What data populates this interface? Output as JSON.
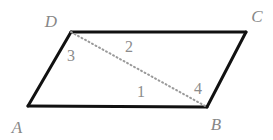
{
  "figure": {
    "background_color": "#ffffff",
    "width": 273,
    "height": 140,
    "edge_color": "#111111",
    "edge_width": 3,
    "diagonal_color": "#9a9a9a",
    "diagonal_style": "dotted",
    "diagonal_width": 2,
    "vertex_label_color": "#878787",
    "angle_label_color": "#8c8c8c"
  },
  "vertices": [
    {
      "id": "A",
      "label": "A",
      "x": 28,
      "y": 106,
      "label_x": 17,
      "label_y": 127
    },
    {
      "id": "B",
      "label": "B",
      "x": 207,
      "y": 107,
      "label_x": 216,
      "label_y": 124
    },
    {
      "id": "C",
      "label": "C",
      "x": 246,
      "y": 32,
      "label_x": 257,
      "label_y": 16
    },
    {
      "id": "D",
      "label": "D",
      "x": 71,
      "y": 32,
      "label_x": 51,
      "label_y": 21
    }
  ],
  "edges": [
    {
      "id": "AB",
      "from": "A",
      "to": "B",
      "style": "solid"
    },
    {
      "id": "BC",
      "from": "B",
      "to": "C",
      "style": "solid"
    },
    {
      "id": "CD",
      "from": "C",
      "to": "D",
      "style": "solid"
    },
    {
      "id": "DA",
      "from": "D",
      "to": "A",
      "style": "solid"
    }
  ],
  "diagonal": {
    "id": "DB",
    "from": "D",
    "to": "B",
    "style": "dotted"
  },
  "angle_labels": [
    {
      "id": "1",
      "label": "1",
      "x": 141,
      "y": 92
    },
    {
      "id": "2",
      "label": "2",
      "x": 129,
      "y": 47
    },
    {
      "id": "3",
      "label": "3",
      "x": 71,
      "y": 56
    },
    {
      "id": "4",
      "label": "4",
      "x": 198,
      "y": 89
    }
  ]
}
